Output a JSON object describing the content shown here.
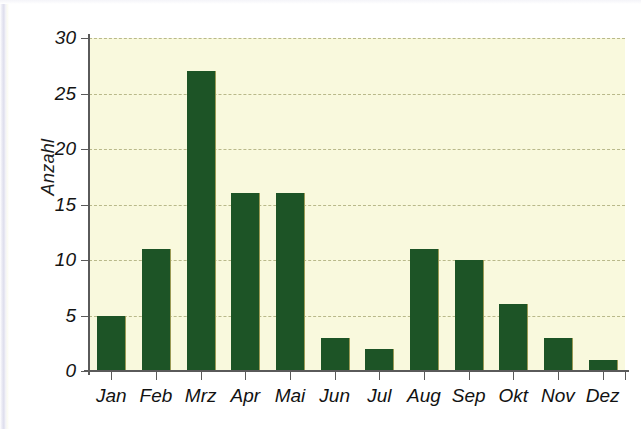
{
  "chart_data": {
    "type": "bar",
    "title": "",
    "subtitle": "",
    "xlabel": "",
    "ylabel": "Anzahl",
    "categories": [
      "Jan",
      "Feb",
      "Mrz",
      "Apr",
      "Mai",
      "Jun",
      "Jul",
      "Aug",
      "Sep",
      "Okt",
      "Nov",
      "Dez"
    ],
    "values": [
      5,
      11,
      27,
      16,
      16,
      3,
      2,
      11,
      10,
      6,
      3,
      1
    ],
    "series": [
      {
        "name": "Anzahl",
        "values": [
          5,
          11,
          27,
          16,
          16,
          3,
          2,
          11,
          10,
          6,
          3,
          1
        ]
      }
    ],
    "ylim": [
      0,
      30
    ],
    "y_ticks": [
      0,
      5,
      10,
      15,
      20,
      25,
      30
    ],
    "y_tick_labels": [
      "0",
      "5",
      "10",
      "15",
      "20",
      "25",
      "30"
    ],
    "grid": true,
    "grid_axis": "y",
    "legend": false,
    "legend_position": "none",
    "colors": {
      "bar": "#1d5426",
      "plot_background": "#f9f9dd",
      "figure_background": "#ffffff",
      "gridline": "#b9b98a",
      "axis": "#5a5a5a",
      "text": "#121212"
    }
  }
}
